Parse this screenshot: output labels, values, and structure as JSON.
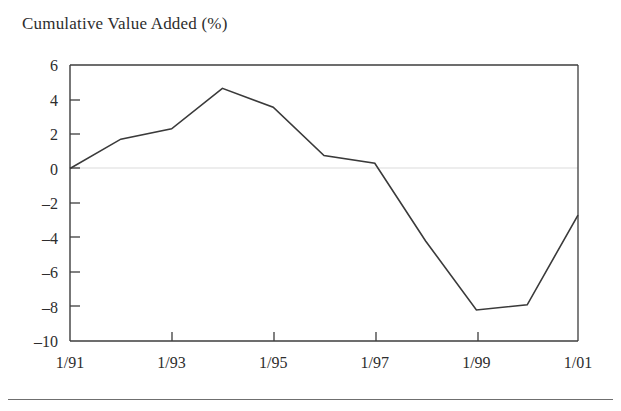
{
  "figure": {
    "title": "Cumulative Value Added (%)",
    "line_color": "#3a3a3a",
    "axis_color": "#3d3d3d",
    "zero_gridline_color": "#e6e6e6",
    "background": "#ffffff"
  },
  "chart_data": {
    "type": "line",
    "title": "Cumulative Value Added (%)",
    "xlabel": "",
    "ylabel": "",
    "x": [
      "1/91",
      "1/92",
      "1/93",
      "1/94",
      "1/95",
      "1/96",
      "1/97",
      "1/98",
      "1/99",
      "1/00",
      "1/01"
    ],
    "values": [
      0,
      1.7,
      2.3,
      4.65,
      3.55,
      0.75,
      0.3,
      -4.2,
      -8.2,
      -7.9,
      -2.7
    ],
    "series": [
      {
        "name": "Cumulative Value Added (%)",
        "values": [
          0,
          1.7,
          2.3,
          4.65,
          3.55,
          0.75,
          0.3,
          -4.2,
          -8.2,
          -7.9,
          -2.7
        ]
      }
    ],
    "xlim": [
      0,
      10
    ],
    "ylim": [
      -10,
      6
    ],
    "ytick_values": [
      6,
      4,
      2,
      0,
      -2,
      -4,
      -6,
      -8,
      -10
    ],
    "ytick_labels": [
      "6",
      "4",
      "2",
      "0",
      "-2",
      "-4",
      "-6",
      "-8",
      "-10"
    ],
    "xtick_values": [
      0,
      2,
      4,
      6,
      8,
      10
    ],
    "xtick_labels": [
      "1/91",
      "1/93",
      "1/95",
      "1/97",
      "1/99",
      "1/01"
    ],
    "grid": false,
    "zero_line": true,
    "legend": null,
    "legend_position": "none",
    "annotations": []
  },
  "axis": {
    "y_labels": [
      "6",
      "4",
      "2",
      "0",
      "-2",
      "-4",
      "-6",
      "-8",
      "-10"
    ],
    "x_labels": [
      "1/91",
      "1/93",
      "1/95",
      "1/97",
      "1/99",
      "1/01"
    ]
  }
}
